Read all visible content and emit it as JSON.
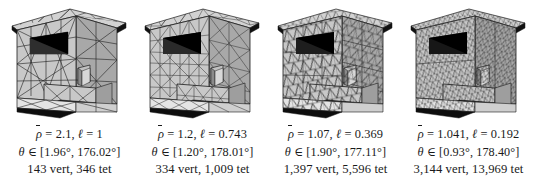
{
  "figure": {
    "type": "mesh-refinement-sequence",
    "background_color": "#ffffff",
    "ink_color": "#1a1a1a",
    "face_fill_color": "#c8c8c8",
    "face_fill_dark": "#9a9a9a",
    "cavity_color": "#000000"
  },
  "panels": [
    {
      "id": "mesh-1",
      "mesh_density": 1,
      "rho_symbol": "ρ",
      "rho_value": "2.1",
      "ell_symbol": "ℓ",
      "ell_value": "1",
      "theta_symbol": "θ",
      "theta_min": "1.96°",
      "theta_max": "176.02°",
      "vertices": "143",
      "tets": "346",
      "line1": "ρ̄ = 2.1, ℓ = 1",
      "line2": "θ ∈ [1.96°, 176.02°]",
      "line3": "143 vert, 346 tet"
    },
    {
      "id": "mesh-2",
      "mesh_density": 2,
      "rho_symbol": "ρ",
      "rho_value": "1.2",
      "ell_symbol": "ℓ",
      "ell_value": "0.743",
      "theta_symbol": "θ",
      "theta_min": "1.20°",
      "theta_max": "178.01°",
      "vertices": "334",
      "tets": "1,009",
      "line1": "ρ̄ = 1.2, ℓ = 0.743",
      "line2": "θ ∈ [1.20°, 178.01°]",
      "line3": "334 vert, 1,009 tet"
    },
    {
      "id": "mesh-3",
      "mesh_density": 3,
      "rho_symbol": "ρ",
      "rho_value": "1.07",
      "ell_symbol": "ℓ",
      "ell_value": "0.369",
      "theta_symbol": "θ",
      "theta_min": "1.90°",
      "theta_max": "177.11°",
      "vertices": "1,397",
      "tets": "5,596",
      "line1": "ρ̄ = 1.07, ℓ = 0.369",
      "line2": "θ ∈ [1.90°, 177.11°]",
      "line3": "1,397 vert, 5,596 tet"
    },
    {
      "id": "mesh-4",
      "mesh_density": 4,
      "rho_symbol": "ρ",
      "rho_value": "1.041",
      "ell_symbol": "ℓ",
      "ell_value": "0.192",
      "theta_symbol": "θ",
      "theta_min": "0.93°",
      "theta_max": "178.40°",
      "vertices": "3,144",
      "tets": "13,969",
      "line1": "ρ̄ = 1.041, ℓ = 0.192",
      "line2": "θ ∈ [0.93°, 178.40°]",
      "line3": "3,144 vert, 13,969 tet"
    }
  ]
}
